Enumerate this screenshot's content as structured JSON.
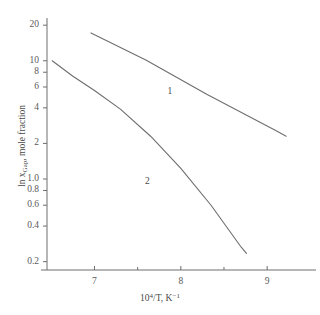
{
  "chart_data": {
    "type": "line",
    "title": "",
    "xlabel": "10⁴/T, K⁻¹",
    "ylabel": "ln x Gap, mole fraction",
    "ylabel_parts": {
      "pre": "ln x",
      "sub": "Gap",
      "post": ", mole fraction"
    },
    "xlabel_parts": {
      "base": "10",
      "exp": "4",
      "mid": "/T, K",
      "exp2": "−1"
    },
    "xscale": "linear",
    "yscale": "log",
    "xlim": [
      6.45,
      9.45
    ],
    "ylim": [
      0.17,
      23.0
    ],
    "grid": false,
    "legend": "inline-curve-labels",
    "xticks": [
      7,
      8,
      9
    ],
    "xticklabels": [
      "7",
      "8",
      "9"
    ],
    "xminorticks": [
      7.5,
      8.5,
      9.5
    ],
    "yticks": [
      0.2,
      0.4,
      0.6,
      0.8,
      1.0,
      2,
      4,
      6,
      8,
      10,
      20
    ],
    "yticklabels": [
      "0.2",
      "0.4",
      "0.6",
      "0.8",
      "1.0",
      "2",
      "4",
      "6",
      "8",
      "10",
      "20"
    ],
    "series": [
      {
        "name": "1",
        "label": "1",
        "label_x": 7.88,
        "label_y": 5.4,
        "color": "#6e6e6e",
        "points": [
          {
            "x": 6.96,
            "y": 17.2
          },
          {
            "x": 7.6,
            "y": 10.1
          },
          {
            "x": 8.3,
            "y": 5.2
          },
          {
            "x": 9.11,
            "y": 2.55
          },
          {
            "x": 9.22,
            "y": 2.3
          }
        ]
      },
      {
        "name": "2",
        "label": "2",
        "label_x": 7.62,
        "label_y": 0.95,
        "color": "#6e6e6e",
        "points": [
          {
            "x": 6.51,
            "y": 10.0
          },
          {
            "x": 6.75,
            "y": 7.4
          },
          {
            "x": 7.0,
            "y": 5.6
          },
          {
            "x": 7.3,
            "y": 3.9
          },
          {
            "x": 7.65,
            "y": 2.3
          },
          {
            "x": 8.0,
            "y": 1.23
          },
          {
            "x": 8.35,
            "y": 0.6
          },
          {
            "x": 8.7,
            "y": 0.265
          },
          {
            "x": 8.76,
            "y": 0.235
          }
        ]
      }
    ],
    "axis_color": "#6e6e6e"
  }
}
